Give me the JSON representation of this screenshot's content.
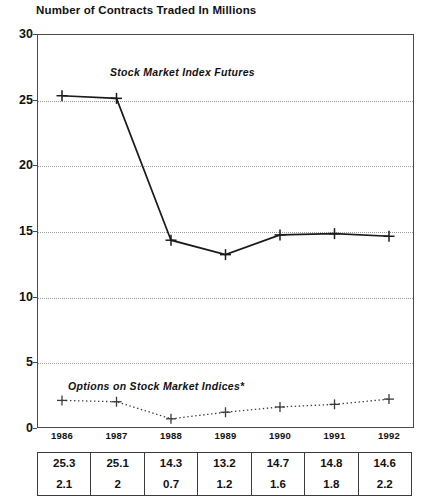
{
  "chart_data": {
    "type": "line",
    "title": "Number of Contracts Traded In Millions",
    "xlabel": "",
    "ylabel": "",
    "ylim": [
      0,
      30
    ],
    "yticks": [
      0,
      5,
      10,
      15,
      20,
      25,
      30
    ],
    "grid": "horizontal-dotted",
    "legend": "inline-annotations",
    "categories": [
      "1986",
      "1987",
      "1988",
      "1989",
      "1990",
      "1991",
      "1992"
    ],
    "series": [
      {
        "name": "Stock Market Index Futures",
        "style": "solid-line-plus-markers",
        "values": [
          25.3,
          25.1,
          14.3,
          13.2,
          14.7,
          14.8,
          14.6
        ]
      },
      {
        "name": "Options on Stock Market Indices*",
        "style": "dotted-line-plus-markers",
        "values": [
          2.1,
          2,
          0.7,
          1.2,
          1.6,
          1.8,
          2.2
        ]
      }
    ],
    "annotations": [
      "Stock Market Index Futures",
      "Options on Stock Market Indices*"
    ]
  },
  "table": {
    "columns": [
      "1986",
      "1987",
      "1988",
      "1989",
      "1990",
      "1991",
      "1992"
    ],
    "rows": [
      [
        "25.3",
        "25.1",
        "14.3",
        "13.2",
        "14.7",
        "14.8",
        "14.6"
      ],
      [
        "2.1",
        "2",
        "0.7",
        "1.2",
        "1.6",
        "1.8",
        "2.2"
      ]
    ]
  },
  "colors": {
    "series_futures": "#1a1a1a",
    "series_options": "#3a3a3a",
    "axis": "#4a4a4a",
    "grid": "#9a9a9a",
    "text": "#111111",
    "background": "#ffffff"
  }
}
